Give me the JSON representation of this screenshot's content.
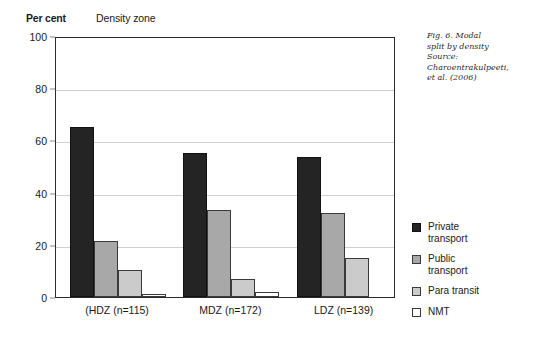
{
  "figure": {
    "unit_label": "Per cent",
    "group_axis_title": "Density zone"
  },
  "caption": {
    "line1": "Fig. 6. Modal",
    "line2": "split by density",
    "line3": "Source:",
    "line4": "Charoentrakulpeeti,",
    "line5": "et al. (2006)"
  },
  "legend": {
    "position": "right",
    "items": [
      {
        "label": "Private\ntransport",
        "color": "#242424"
      },
      {
        "label": "Public\ntransport",
        "color": "#a8a8a8"
      },
      {
        "label": "Para transit",
        "color": "#cbcbcb"
      },
      {
        "label": "NMT",
        "color": "#ffffff"
      }
    ]
  },
  "chart_data": {
    "type": "bar",
    "title": "Fig. 6. Modal split by density",
    "xlabel": "Density zone",
    "ylabel": "Per cent",
    "ylim": [
      0,
      100
    ],
    "yticks": [
      0,
      20,
      40,
      60,
      80,
      100
    ],
    "ytick_labels": [
      "0",
      "20",
      "40",
      "60",
      "80",
      "100"
    ],
    "grid": true,
    "legend_position": "right",
    "categories": [
      "(HDZ (n=115)",
      "MDZ (n=172)",
      "LDZ (n=139)"
    ],
    "series": [
      {
        "name": "Private transport",
        "color": "#242424",
        "values": [
          65,
          55,
          53.5
        ]
      },
      {
        "name": "Public transport",
        "color": "#a8a8a8",
        "values": [
          21.5,
          33.5,
          32
        ]
      },
      {
        "name": "Para transit",
        "color": "#cbcbcb",
        "values": [
          10.5,
          7,
          15
        ]
      },
      {
        "name": "NMT",
        "color": "#ffffff",
        "values": [
          1,
          2,
          0
        ]
      }
    ],
    "source": "Charoentrakulpeeti, et al. (2006)"
  }
}
